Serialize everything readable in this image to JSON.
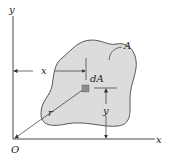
{
  "figure": {
    "labels": {
      "y_axis": "y",
      "x_axis": "x",
      "origin": "O",
      "area": "A",
      "element": "dA",
      "x_distance": "x",
      "y_distance": "y",
      "radius": "r"
    },
    "colors": {
      "region_fill": "#dcdcdc",
      "element_fill": "#8c8c8c",
      "line": "#333333"
    }
  }
}
